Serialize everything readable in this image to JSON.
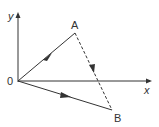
{
  "diagram": {
    "labels": {
      "y_axis": "y",
      "x_axis": "x",
      "origin": "0",
      "point_a": "A",
      "point_b": "B"
    },
    "vectors": [
      {
        "from": "0",
        "to": "A",
        "style": "solid"
      },
      {
        "from": "A",
        "to": "B",
        "style": "dashed"
      },
      {
        "from": "0",
        "to": "B",
        "style": "solid"
      }
    ],
    "colors": {
      "stroke": "#333333"
    }
  }
}
